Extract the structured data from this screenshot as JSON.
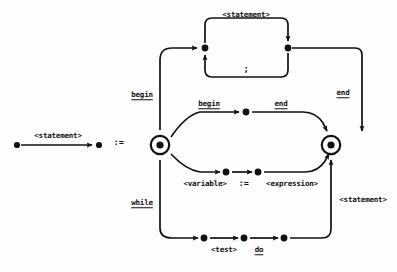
{
  "diagram": {
    "type": "syntax-railroad-diagram",
    "title": "statement",
    "definition_symbol": ":=",
    "nonterminal_defined": "<statement>",
    "colors": {
      "ink": "#111111",
      "background": "#fdfdfd"
    },
    "labels": {
      "lhs_statement": "<statement>",
      "defines": ":=",
      "top_statement": "<statement>",
      "semicolon": ";",
      "begin_outer": "begin",
      "end_outer": "end",
      "begin_inner": "begin",
      "end_inner": "end",
      "variable": "<variable>",
      "assign": ":=",
      "expression": "<expression>",
      "while": "while",
      "test": "<test>",
      "do": "do",
      "statement_return": "<statement>"
    },
    "nodes": [
      {
        "name": "lhs-start-node",
        "kind": "dot",
        "x": 17,
        "y": 145
      },
      {
        "name": "lhs-end-node",
        "kind": "dot",
        "x": 99,
        "y": 145
      },
      {
        "name": "entry-node",
        "kind": "double-circle",
        "x": 160,
        "y": 145
      },
      {
        "name": "exit-node",
        "kind": "double-circle",
        "x": 331,
        "y": 145
      },
      {
        "name": "loop-left-node",
        "kind": "dot",
        "x": 205,
        "y": 48
      },
      {
        "name": "loop-right-node",
        "kind": "dot",
        "x": 288,
        "y": 48
      },
      {
        "name": "begin-after-node",
        "kind": "dot",
        "x": 246,
        "y": 115
      },
      {
        "name": "variable-after-node",
        "kind": "dot",
        "x": 227,
        "y": 172
      },
      {
        "name": "assign-after-node",
        "kind": "dot",
        "x": 259,
        "y": 172
      },
      {
        "name": "while-first-node",
        "kind": "dot",
        "x": 205,
        "y": 238
      },
      {
        "name": "test-after-node",
        "kind": "dot",
        "x": 245,
        "y": 238
      },
      {
        "name": "do-after-node",
        "kind": "dot",
        "x": 285,
        "y": 238
      }
    ],
    "branches": [
      {
        "name": "compound-statement-branch",
        "keywords": [
          "begin",
          "end"
        ],
        "body": "<statement>",
        "separator": ";"
      },
      {
        "name": "assignment-branch",
        "parts": [
          "<variable>",
          ":=",
          "<expression>"
        ]
      },
      {
        "name": "while-branch",
        "keywords": [
          "while",
          "do"
        ],
        "parts": [
          "<test>",
          "<statement>"
        ]
      }
    ]
  }
}
